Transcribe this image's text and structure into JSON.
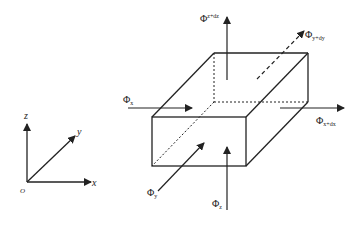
{
  "axes": {
    "origin": "O",
    "x": "x",
    "y": "y",
    "z": "z"
  },
  "flux_labels": {
    "phi_x": {
      "base": "Φ",
      "sub": "x"
    },
    "phi_x_dx": {
      "base": "Φ",
      "sub": "x+dx"
    },
    "phi_y": {
      "base": "Φ",
      "sub": "y"
    },
    "phi_y_dy": {
      "base": "Φ",
      "sub": "y+dy"
    },
    "phi_z": {
      "base": "Φ",
      "sub": "z"
    },
    "phi_z_dz": {
      "base": "Φ",
      "sub": "z+dz"
    }
  },
  "colors": {
    "stroke": "#222222",
    "background": "#ffffff"
  }
}
